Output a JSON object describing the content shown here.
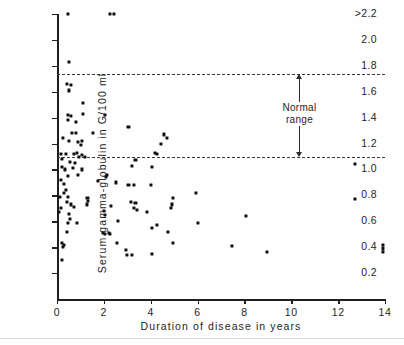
{
  "chart_data": {
    "type": "scatter",
    "title": "",
    "xlabel": "Duration of disease in years",
    "ylabel": "Serum gamma-globulin in G/100 ml",
    "xlim": [
      0,
      14
    ],
    "ylim": [
      0.1,
      2.2
    ],
    "grid": false,
    "legend": null,
    "xticks": [
      0,
      2,
      4,
      6,
      8,
      10,
      12,
      14
    ],
    "xticklabels": [
      "0",
      "2",
      "4",
      "6",
      "8",
      "10",
      "12",
      "14"
    ],
    "yticks": [
      0.2,
      0.4,
      0.6,
      0.8,
      1.0,
      1.2,
      1.4,
      1.6,
      1.8,
      2.0,
      2.2
    ],
    "yticklabels": [
      "0.2",
      "0.4",
      "0.6",
      "0.8",
      "1.0",
      "1.2",
      "1.4",
      "1.6",
      "1.8",
      "2.0",
      ">2.2"
    ],
    "reference_lines": [
      {
        "name": "normal-range-upper",
        "y": 1.74,
        "style": "dashed"
      },
      {
        "name": "normal-range-lower",
        "y": 1.1,
        "style": "dashed"
      }
    ],
    "annotations": [
      {
        "name": "normal-range",
        "text_line1": "Normal",
        "text_line2": "range",
        "x": 10.35,
        "y_top": 1.74,
        "y_bottom": 1.1,
        "arrow": "double"
      }
    ],
    "points": [
      [
        0.45,
        2.2
      ],
      [
        2.25,
        2.2
      ],
      [
        2.45,
        2.2
      ],
      [
        0.5,
        1.83
      ],
      [
        0.42,
        1.66
      ],
      [
        0.58,
        1.65
      ],
      [
        0.52,
        1.61
      ],
      [
        1.12,
        1.51
      ],
      [
        0.45,
        1.42
      ],
      [
        0.6,
        1.41
      ],
      [
        1.1,
        1.43
      ],
      [
        2.05,
        1.42
      ],
      [
        0.48,
        1.38
      ],
      [
        0.82,
        1.37
      ],
      [
        0.25,
        1.24
      ],
      [
        0.62,
        1.28
      ],
      [
        0.8,
        1.28
      ],
      [
        1.55,
        1.28
      ],
      [
        3.05,
        1.33
      ],
      [
        0.5,
        1.22
      ],
      [
        0.88,
        1.21
      ],
      [
        1.02,
        1.19
      ],
      [
        1.06,
        1.22
      ],
      [
        4.55,
        1.27
      ],
      [
        4.7,
        1.24
      ],
      [
        4.45,
        1.2
      ],
      [
        0.18,
        1.12
      ],
      [
        0.38,
        1.12
      ],
      [
        0.72,
        1.12
      ],
      [
        0.86,
        1.13
      ],
      [
        0.95,
        1.1
      ],
      [
        1.08,
        1.11
      ],
      [
        1.18,
        1.1
      ],
      [
        4.2,
        1.13
      ],
      [
        4.28,
        1.12
      ],
      [
        0.22,
        1.08
      ],
      [
        0.55,
        1.06
      ],
      [
        0.78,
        1.05
      ],
      [
        3.35,
        1.07
      ],
      [
        0.2,
        1.02
      ],
      [
        0.35,
        1.0
      ],
      [
        0.7,
        1.01
      ],
      [
        1.05,
        1.0
      ],
      [
        3.2,
        1.03
      ],
      [
        4.05,
        1.02
      ],
      [
        12.7,
        1.04
      ],
      [
        0.45,
        0.95
      ],
      [
        0.9,
        0.96
      ],
      [
        2.15,
        0.96
      ],
      [
        2.1,
        0.94
      ],
      [
        0.15,
        0.92
      ],
      [
        1.75,
        0.91
      ],
      [
        2.5,
        0.9
      ],
      [
        0.28,
        0.89
      ],
      [
        3.05,
        0.88
      ],
      [
        3.3,
        0.88
      ],
      [
        4.0,
        0.88
      ],
      [
        0.38,
        0.84
      ],
      [
        0.3,
        0.82
      ],
      [
        5.95,
        0.82
      ],
      [
        0.12,
        0.79
      ],
      [
        0.45,
        0.79
      ],
      [
        1.3,
        0.78
      ],
      [
        1.32,
        0.76
      ],
      [
        4.95,
        0.78
      ],
      [
        12.7,
        0.77
      ],
      [
        0.42,
        0.75
      ],
      [
        0.6,
        0.73
      ],
      [
        1.28,
        0.73
      ],
      [
        3.15,
        0.75
      ],
      [
        3.35,
        0.74
      ],
      [
        4.9,
        0.73
      ],
      [
        0.18,
        0.7
      ],
      [
        0.72,
        0.71
      ],
      [
        2.3,
        0.72
      ],
      [
        3.3,
        0.7
      ],
      [
        3.42,
        0.69
      ],
      [
        4.88,
        0.7
      ],
      [
        2.0,
        0.68
      ],
      [
        3.85,
        0.67
      ],
      [
        0.1,
        0.67
      ],
      [
        0.52,
        0.66
      ],
      [
        2.05,
        0.65
      ],
      [
        0.55,
        0.62
      ],
      [
        8.05,
        0.64
      ],
      [
        0.48,
        0.59
      ],
      [
        0.85,
        0.59
      ],
      [
        2.6,
        0.6
      ],
      [
        6.0,
        0.59
      ],
      [
        4.25,
        0.57
      ],
      [
        4.05,
        0.55
      ],
      [
        0.42,
        0.52
      ],
      [
        1.95,
        0.51
      ],
      [
        2.2,
        0.51
      ],
      [
        4.75,
        0.52
      ],
      [
        2.05,
        0.5
      ],
      [
        2.25,
        0.5
      ],
      [
        0.22,
        0.43
      ],
      [
        0.28,
        0.42
      ],
      [
        2.55,
        0.43
      ],
      [
        4.95,
        0.43
      ],
      [
        7.45,
        0.41
      ],
      [
        13.9,
        0.42
      ],
      [
        0.26,
        0.4
      ],
      [
        13.92,
        0.39
      ],
      [
        2.95,
        0.38
      ],
      [
        8.95,
        0.36
      ],
      [
        4.05,
        0.35
      ],
      [
        3.0,
        0.34
      ],
      [
        3.2,
        0.34
      ],
      [
        13.9,
        0.36
      ],
      [
        0.2,
        0.3
      ]
    ]
  }
}
